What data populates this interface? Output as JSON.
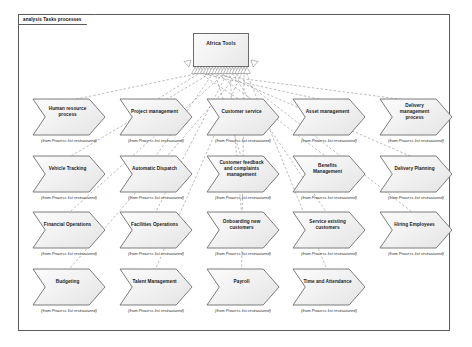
{
  "frame": {
    "tab_label": "analysis Tasks processes"
  },
  "hub": {
    "name": "Africa Tools",
    "x": 193,
    "y": 33,
    "w": 56,
    "h": 34
  },
  "from_caption": "(from Process list restructured)",
  "colors": {
    "frame_border": "#5a5a5a",
    "node_border": "#6e6e6e",
    "node_fill": "#f1f1f1",
    "connector": "#8d8d8d",
    "text": "#1b1b1b",
    "background": "#ffffff"
  },
  "layout": {
    "node_w": 72,
    "node_h": 36,
    "col_x": [
      33,
      120,
      207,
      293,
      380
    ],
    "row_y": [
      99,
      156,
      212,
      269
    ],
    "caption_dy": 39
  },
  "nodes": [
    {
      "label": "Human resource process",
      "row": 0,
      "col": 0
    },
    {
      "label": "Project management",
      "row": 0,
      "col": 1
    },
    {
      "label": "Customer service",
      "row": 0,
      "col": 2
    },
    {
      "label": "Asset management",
      "row": 0,
      "col": 3
    },
    {
      "label": "Delivery management process",
      "row": 0,
      "col": 4
    },
    {
      "label": "Vehicle Tracking",
      "row": 1,
      "col": 0
    },
    {
      "label": "Automatic Dispatch",
      "row": 1,
      "col": 1
    },
    {
      "label": "Customer feedback and complaints management",
      "row": 1,
      "col": 2
    },
    {
      "label": "Benefits Management",
      "row": 1,
      "col": 3
    },
    {
      "label": "Delivery Planning",
      "row": 1,
      "col": 4
    },
    {
      "label": "Financial Operations",
      "row": 2,
      "col": 0
    },
    {
      "label": "Facilities Operations",
      "row": 2,
      "col": 1
    },
    {
      "label": "Onboarding new customers",
      "row": 2,
      "col": 2
    },
    {
      "label": "Service existing customers",
      "row": 2,
      "col": 3
    },
    {
      "label": "Hiring Employees",
      "row": 2,
      "col": 4
    },
    {
      "label": "Budgeting",
      "row": 3,
      "col": 0
    },
    {
      "label": "Talent Management",
      "row": 3,
      "col": 1
    },
    {
      "label": "Payroll",
      "row": 3,
      "col": 2
    },
    {
      "label": "Time and Attendance",
      "row": 3,
      "col": 3
    }
  ]
}
